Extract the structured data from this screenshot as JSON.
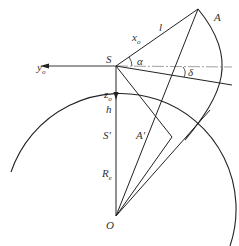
{
  "diagram": {
    "type": "satellite-earth geometry",
    "points": {
      "S": {
        "label": "S",
        "x": 116,
        "y": 66
      },
      "A": {
        "label": "A",
        "x": 198,
        "y": 9
      },
      "S_prime": {
        "label": "S'",
        "x": 116,
        "y": 117
      },
      "A_prime": {
        "label": "A'",
        "x": 150,
        "y": 128
      },
      "O": {
        "label": "O",
        "x": 116,
        "y": 216
      }
    },
    "labels": {
      "A": "A",
      "S": "S",
      "l": "l",
      "x_o": "x",
      "x_sub": "o",
      "y_o": "y",
      "y_sub": "o",
      "z_o": "z",
      "z_sub": "o",
      "alpha": "α",
      "delta": "δ",
      "h": "h",
      "S_prime": "S'",
      "A_prime": "A'",
      "R_e": "R",
      "R_sub": "e",
      "O": "O"
    },
    "colors": {
      "line": "#222222",
      "axis": "#888888",
      "text": "#333333"
    }
  }
}
